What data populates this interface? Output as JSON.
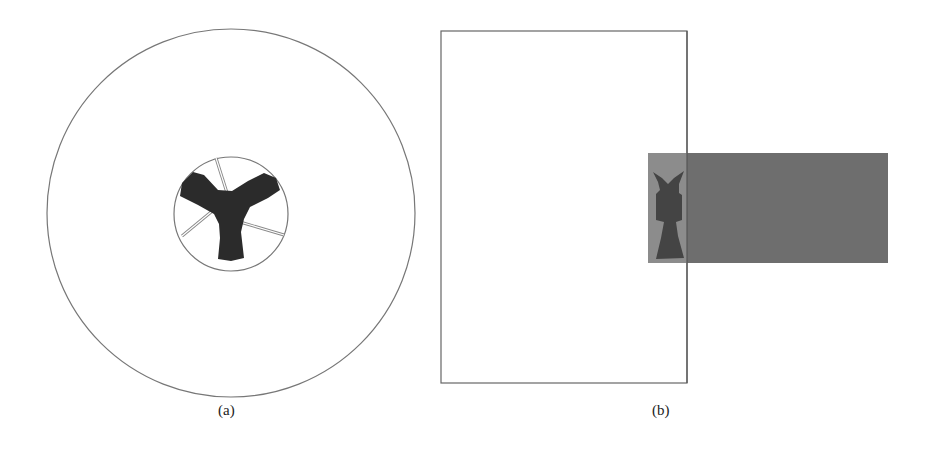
{
  "figure": {
    "panels": [
      {
        "id": "a",
        "caption": "(a)",
        "description": "Top view: large outer circle with a small central circle containing a dark three-bladed (Y-shaped) propeller/hub and thin spokes"
      },
      {
        "id": "b",
        "caption": "(b)",
        "description": "Side view: tall rectangular outline with a grey horizontal cylinder protruding to the right; dark hub shape at the left end of the cylinder"
      }
    ],
    "colors": {
      "outline": "#777777",
      "hub": "#2a2a2a",
      "cylinder": "#6e6e6e",
      "cylinder_overlap": "#8a8a8a",
      "background": "#ffffff"
    }
  }
}
